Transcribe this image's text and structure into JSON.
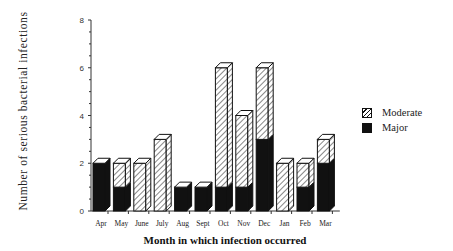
{
  "chart_data": {
    "type": "bar",
    "stacked": true,
    "style": "3d",
    "title": "",
    "xlabel": "Month in which infection occurred",
    "ylabel": "Number of serious bacterial infections",
    "ylim": [
      0,
      8
    ],
    "yticks": [
      0,
      2,
      4,
      6,
      8
    ],
    "categories": [
      "Apr",
      "May",
      "June",
      "July",
      "Aug",
      "Sept",
      "Oct",
      "Nov",
      "Dec",
      "Jan",
      "Feb",
      "Mar"
    ],
    "series": [
      {
        "name": "Major",
        "pattern": "solid-black",
        "values": [
          2,
          1,
          0,
          0,
          1,
          1,
          1,
          1,
          3,
          0,
          1,
          2
        ]
      },
      {
        "name": "Moderate",
        "pattern": "diagonal-hatch",
        "values": [
          0,
          1,
          2,
          3,
          0,
          0,
          5,
          3,
          3,
          2,
          1,
          1
        ]
      }
    ],
    "legend": {
      "position": "right",
      "entries": [
        "Moderate",
        "Major"
      ]
    },
    "grid": false
  },
  "legend": {
    "moderate_label": "Moderate",
    "major_label": "Major"
  },
  "axes": {
    "xlabel": "Month in which infection occurred",
    "ylabel": "Number of serious bacterial infections"
  }
}
